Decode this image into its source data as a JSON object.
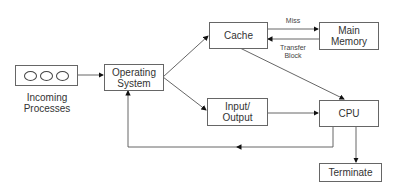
{
  "diagram": {
    "nodes": {
      "incoming": {
        "label_line1": "Incoming",
        "label_line2": "Processes",
        "circle_count": 3
      },
      "os": {
        "line1": "Operating",
        "line2": "System"
      },
      "cache": {
        "label": "Cache"
      },
      "main_memory": {
        "line1": "Main",
        "line2": "Memory"
      },
      "io": {
        "line1": "Input/",
        "line2": "Output"
      },
      "cpu": {
        "label": "CPU"
      },
      "terminate": {
        "label": "Terminate"
      }
    },
    "edge_labels": {
      "miss": "Miss",
      "transfer_line1": "Transfer",
      "transfer_line2": "Block"
    },
    "edges": [
      {
        "from": "incoming",
        "to": "os"
      },
      {
        "from": "os",
        "to": "cache"
      },
      {
        "from": "os",
        "to": "io"
      },
      {
        "from": "cache",
        "to": "main_memory",
        "label": "Miss"
      },
      {
        "from": "main_memory",
        "to": "cache",
        "label": "Transfer Block"
      },
      {
        "from": "cache",
        "to": "cpu"
      },
      {
        "from": "io",
        "to": "cpu"
      },
      {
        "from": "cpu",
        "to": "terminate"
      },
      {
        "from": "cpu",
        "to": "os"
      }
    ]
  }
}
